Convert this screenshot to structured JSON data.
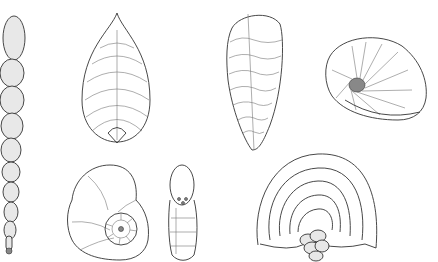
{
  "image": {
    "description": "Scientific line illustration plate of seven foraminifera shell specimens drawn in black ink stipple on a white background",
    "background_color": "#ffffff",
    "ink_color": "#333333",
    "specimens": [
      {
        "id": "uniserial-chain",
        "label": "Uniserial chain of globular chambers",
        "position": "left edge, full height"
      },
      {
        "id": "teardrop-chevron",
        "label": "Teardrop-shaped test with chevron chambers",
        "position": "top, left-center"
      },
      {
        "id": "biserial-elongate",
        "label": "Elongate biserial test",
        "position": "top, center-right"
      },
      {
        "id": "planispiral-lateral",
        "label": "Planispiral test, oblique view",
        "position": "top right"
      },
      {
        "id": "trochospiral-umbilical",
        "label": "Coiled test showing spiral chambers",
        "position": "bottom, left-center"
      },
      {
        "id": "edge-view",
        "label": "Edge view of coiled test with aperture",
        "position": "bottom center"
      },
      {
        "id": "fan-shaped",
        "label": "Fan-shaped test with concentric chambers",
        "position": "bottom right"
      }
    ]
  }
}
